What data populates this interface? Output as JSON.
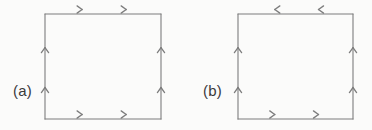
{
  "figure": {
    "background_color": "#fbfbfa",
    "stroke_color": "#7d7d7d",
    "label_color": "#3a3a3a",
    "stroke_width": 1.1
  },
  "panels": [
    {
      "id": "a",
      "label": "(a)",
      "square": {
        "x": 45,
        "y": 14,
        "width": 116,
        "height": 105
      },
      "edges": [
        {
          "name": "top",
          "direction": "right",
          "arrow_count": 2
        },
        {
          "name": "right",
          "direction": "up",
          "arrow_count": 2
        },
        {
          "name": "bottom",
          "direction": "right",
          "arrow_count": 2
        },
        {
          "name": "left",
          "direction": "up",
          "arrow_count": 2
        }
      ]
    },
    {
      "id": "b",
      "label": "(b)",
      "square": {
        "x": 238,
        "y": 14,
        "width": 115,
        "height": 105
      },
      "edges": [
        {
          "name": "top",
          "direction": "left",
          "arrow_count": 2
        },
        {
          "name": "right",
          "direction": "up",
          "arrow_count": 2
        },
        {
          "name": "bottom",
          "direction": "right",
          "arrow_count": 2
        },
        {
          "name": "left",
          "direction": "up",
          "arrow_count": 2
        }
      ]
    }
  ]
}
